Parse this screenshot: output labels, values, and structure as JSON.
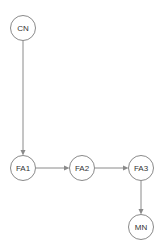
{
  "diagram": {
    "type": "directed-graph",
    "nodes": [
      {
        "id": "CN",
        "label": "CN",
        "cx": 23,
        "cy": 28,
        "r": 12.5
      },
      {
        "id": "FA1",
        "label": "FA1",
        "cx": 23,
        "cy": 168,
        "r": 12.5
      },
      {
        "id": "FA2",
        "label": "FA2",
        "cx": 82,
        "cy": 168,
        "r": 12.5
      },
      {
        "id": "FA3",
        "label": "FA3",
        "cx": 141,
        "cy": 168,
        "r": 12.5
      },
      {
        "id": "MN",
        "label": "MN",
        "cx": 141,
        "cy": 227,
        "r": 12.5
      }
    ],
    "edges": [
      {
        "from": "CN",
        "to": "FA1"
      },
      {
        "from": "FA1",
        "to": "FA2"
      },
      {
        "from": "FA2",
        "to": "FA3"
      },
      {
        "from": "FA3",
        "to": "MN"
      }
    ],
    "colors": {
      "stroke": "#8a8a8a",
      "text": "#333333",
      "background": "#ffffff"
    }
  }
}
